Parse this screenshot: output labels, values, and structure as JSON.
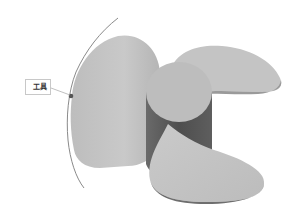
{
  "viewport": {
    "description": "3D propeller model view",
    "background": "#ffffff"
  },
  "tooltip": {
    "label": "工具"
  },
  "model": {
    "name": "propeller",
    "blade_count": 3,
    "colors": {
      "blade_face": "#c4c4c4",
      "blade_shadow": "#9a9a9a",
      "hub_top": "#bdbdbd",
      "hub_side": "#5a5a5a",
      "guide_curve": "#8a8a8a",
      "pick_point": "#555555"
    }
  }
}
